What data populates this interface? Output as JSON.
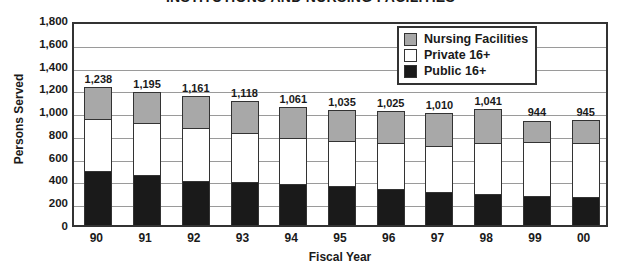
{
  "chart_data": {
    "type": "bar",
    "subtype": "stacked-vertical",
    "title": "INSTITUTIONS AND NURSING FACILITIES",
    "xlabel": "Fiscal Year",
    "ylabel": "Persons Served",
    "ylim": [
      0,
      1800
    ],
    "ytick_step": 200,
    "grid": true,
    "legend_position": "top-right",
    "categories": [
      "90",
      "91",
      "92",
      "93",
      "94",
      "95",
      "96",
      "97",
      "98",
      "99",
      "00"
    ],
    "series": [
      {
        "name": "Public 16+",
        "color": "#1a1a1a",
        "values": [
          483,
          446,
          395,
          386,
          368,
          351,
          325,
          298,
          281,
          263,
          254
        ]
      },
      {
        "name": "Private 16+",
        "color": "#ffffff",
        "values": [
          465,
          469,
          476,
          442,
          413,
          404,
          410,
          412,
          460,
          481,
          481
        ]
      },
      {
        "name": "Nursing Facilities",
        "color": "#a8a8a8",
        "values": [
          290,
          280,
          290,
          290,
          280,
          280,
          290,
          300,
          300,
          200,
          210
        ]
      }
    ],
    "totals": [
      1238,
      1195,
      1161,
      1118,
      1061,
      1035,
      1025,
      1010,
      1041,
      944,
      945
    ],
    "total_labels": [
      "1,238",
      "1,195",
      "1,161",
      "1,118",
      "1,061",
      "1,035",
      "1,025",
      "1,010",
      "1,041",
      "944",
      "945"
    ],
    "ytick_labels": [
      "1,800",
      "1,600",
      "1,400",
      "1,200",
      "1,000",
      "800",
      "600",
      "400",
      "200",
      "0"
    ],
    "ytick_values": [
      1800,
      1600,
      1400,
      1200,
      1000,
      800,
      600,
      400,
      200,
      0
    ]
  },
  "legend": {
    "entries": [
      {
        "label": "Nursing Facilities",
        "color": "#a8a8a8"
      },
      {
        "label": "Private 16+",
        "color": "#ffffff"
      },
      {
        "label": "Public 16+",
        "color": "#1a1a1a"
      }
    ]
  }
}
